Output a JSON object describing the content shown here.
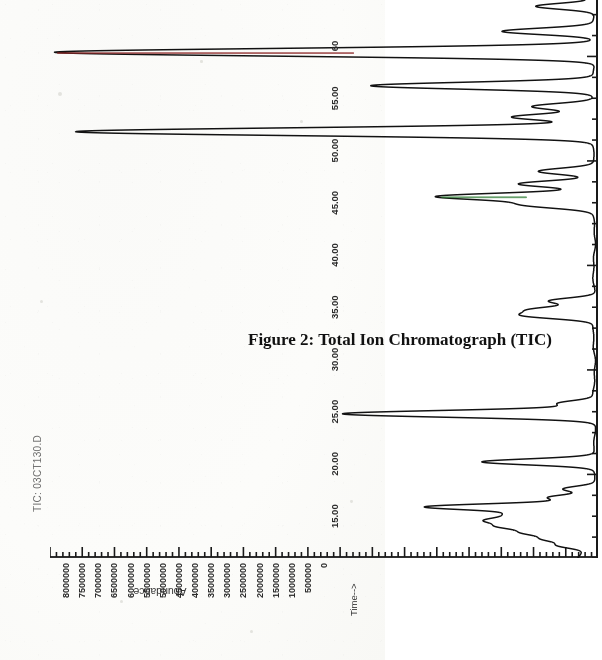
{
  "figure": {
    "caption": "Figure 2: Total Ion Chromatograph (TIC)",
    "series_label": "TIC: 03CT130.D",
    "orientation": "rotated-90-ccw-on-page"
  },
  "chart_data": {
    "type": "line",
    "title": "TIC: 03CT130.D",
    "caption": "Figure 2: Total Ion Chromatograph (TIC)",
    "xlabel": "Time-->",
    "ylabel": "Abundance",
    "xlim": [
      11.0,
      60.0
    ],
    "ylim": [
      0,
      8500000
    ],
    "grid": false,
    "legend_position": "none",
    "x_ticks": [
      "15.00",
      "20.00",
      "25.00",
      "30.00",
      "35.00",
      "40.00",
      "45.00",
      "50.00",
      "55.00",
      "60"
    ],
    "x_tick_values": [
      15,
      20,
      25,
      30,
      35,
      40,
      45,
      50,
      55,
      60
    ],
    "y_ticks": [
      "8000000",
      "7500000",
      "7000000",
      "6500000",
      "6000000",
      "5500000",
      "5000000",
      "4500000",
      "4000000",
      "3500000",
      "3000000",
      "2500000",
      "2000000",
      "1500000",
      "1000000",
      "500000",
      "0"
    ],
    "y_tick_values": [
      8000000,
      7500000,
      7000000,
      6500000,
      6000000,
      5500000,
      5000000,
      4500000,
      4000000,
      3500000,
      3000000,
      2500000,
      2000000,
      1500000,
      1000000,
      500000,
      0
    ],
    "baseline": 60000,
    "peaks": [
      {
        "rt": 11.6,
        "height": 430000,
        "width": 0.13,
        "color": "#1a1a1a"
      },
      {
        "rt": 11.9,
        "height": 620000,
        "width": 0.13,
        "color": "#1a1a1a"
      },
      {
        "rt": 12.2,
        "height": 900000,
        "width": 0.14,
        "color": "#1a1a1a"
      },
      {
        "rt": 12.5,
        "height": 1180000,
        "width": 0.14,
        "color": "#1a1a1a"
      },
      {
        "rt": 12.8,
        "height": 1460000,
        "width": 0.15,
        "color": "#1a1a1a"
      },
      {
        "rt": 13.1,
        "height": 1020000,
        "width": 0.14,
        "color": "#1a1a1a"
      },
      {
        "rt": 13.45,
        "height": 2560000,
        "width": 0.15,
        "color": "#1a1a1a"
      },
      {
        "rt": 13.9,
        "height": 700000,
        "width": 0.13,
        "color": "#1a1a1a"
      },
      {
        "rt": 14.3,
        "height": 480000,
        "width": 0.13,
        "color": "#1a1a1a"
      },
      {
        "rt": 15.6,
        "height": 1720000,
        "width": 0.14,
        "color": "#1a1a1a"
      },
      {
        "rt": 17.9,
        "height": 3900000,
        "width": 0.16,
        "color": "#1a1a1a"
      },
      {
        "rt": 18.4,
        "height": 540000,
        "width": 0.13,
        "color": "#1a1a1a"
      },
      {
        "rt": 22.6,
        "height": 1060000,
        "width": 0.15,
        "color": "#1a1a1a"
      },
      {
        "rt": 22.9,
        "height": 880000,
        "width": 0.14,
        "color": "#1a1a1a"
      },
      {
        "rt": 23.3,
        "height": 700000,
        "width": 0.14,
        "color": "#1a1a1a"
      },
      {
        "rt": 27.9,
        "height": 1040000,
        "width": 0.16,
        "color": "#1a1a1a"
      },
      {
        "rt": 28.3,
        "height": 2420000,
        "width": 0.16,
        "color": "#2f7a35"
      },
      {
        "rt": 28.9,
        "height": 1180000,
        "width": 0.15,
        "color": "#1a1a1a"
      },
      {
        "rt": 29.5,
        "height": 880000,
        "width": 0.15,
        "color": "#1a1a1a"
      },
      {
        "rt": 31.4,
        "height": 8050000,
        "width": 0.18,
        "color": "#1a1a1a"
      },
      {
        "rt": 32.1,
        "height": 1280000,
        "width": 0.15,
        "color": "#1a1a1a"
      },
      {
        "rt": 32.6,
        "height": 980000,
        "width": 0.15,
        "color": "#1a1a1a"
      },
      {
        "rt": 33.6,
        "height": 3460000,
        "width": 0.16,
        "color": "#1a1a1a"
      },
      {
        "rt": 35.2,
        "height": 8380000,
        "width": 0.18,
        "color": "#8a2a2a"
      },
      {
        "rt": 36.2,
        "height": 1420000,
        "width": 0.15,
        "color": "#1a1a1a"
      },
      {
        "rt": 37.4,
        "height": 900000,
        "width": 0.14,
        "color": "#1a1a1a"
      },
      {
        "rt": 38.1,
        "height": 1960000,
        "width": 0.15,
        "color": "#1a1a1a"
      },
      {
        "rt": 38.7,
        "height": 6900000,
        "width": 0.17,
        "color": "#1a1a1a"
      },
      {
        "rt": 39.3,
        "height": 1380000,
        "width": 0.15,
        "color": "#1a1a1a"
      },
      {
        "rt": 39.8,
        "height": 4500000,
        "width": 0.16,
        "color": "#232323"
      },
      {
        "rt": 40.2,
        "height": 4050000,
        "width": 0.16,
        "color": "#9a3030"
      },
      {
        "rt": 40.6,
        "height": 5650000,
        "width": 0.16,
        "color": "#1a1a1a"
      },
      {
        "rt": 41.0,
        "height": 1700000,
        "width": 0.15,
        "color": "#1a1a1a"
      },
      {
        "rt": 41.5,
        "height": 6400000,
        "width": 0.17,
        "color": "#1a1a1a"
      },
      {
        "rt": 42.3,
        "height": 1320000,
        "width": 0.15,
        "color": "#1a1a1a"
      },
      {
        "rt": 43.8,
        "height": 1120000,
        "width": 0.15,
        "color": "#1a1a1a"
      },
      {
        "rt": 44.8,
        "height": 5850000,
        "width": 0.17,
        "color": "#1a1a1a"
      },
      {
        "rt": 46.3,
        "height": 820000,
        "width": 0.14,
        "color": "#1a1a1a"
      },
      {
        "rt": 47.2,
        "height": 5150000,
        "width": 0.17,
        "color": "#1a1a1a"
      },
      {
        "rt": 49.0,
        "height": 660000,
        "width": 0.14,
        "color": "#1a1a1a"
      },
      {
        "rt": 49.6,
        "height": 4300000,
        "width": 0.16,
        "color": "#1a1a1a"
      },
      {
        "rt": 50.2,
        "height": 1150000,
        "width": 0.15,
        "color": "#7d7a33"
      },
      {
        "rt": 51.4,
        "height": 2620000,
        "width": 0.16,
        "color": "#1a1a1a"
      },
      {
        "rt": 52.3,
        "height": 3560000,
        "width": 0.16,
        "color": "#1a1a1a"
      },
      {
        "rt": 53.2,
        "height": 1480000,
        "width": 0.15,
        "color": "#1a1a1a"
      },
      {
        "rt": 54.1,
        "height": 2180000,
        "width": 0.15,
        "color": "#1a1a1a"
      },
      {
        "rt": 55.4,
        "height": 980000,
        "width": 0.14,
        "color": "#1a1a1a"
      },
      {
        "rt": 56.6,
        "height": 740000,
        "width": 0.14,
        "color": "#1a1a1a"
      },
      {
        "rt": 57.6,
        "height": 1900000,
        "width": 0.17,
        "color": "#1a1a1a"
      },
      {
        "rt": 58.2,
        "height": 2380000,
        "width": 0.22,
        "color": "#1a1a1a"
      },
      {
        "rt": 58.8,
        "height": 1480000,
        "width": 0.25,
        "color": "#1a1a1a"
      }
    ]
  }
}
